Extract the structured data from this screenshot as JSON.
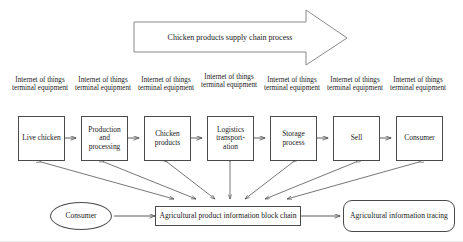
{
  "figure": {
    "title_banner": {
      "label": "Chicken products supply chain process",
      "shape": "block-arrow-right"
    },
    "iot_labels": [
      "Internet of things terminal equipment",
      "Internet of things terminal equipment",
      "Internet of things terminal equipment",
      "Internet of things terminal equipment",
      "Internet of things terminal equipment",
      "Internet of things terminal equipment",
      "Internet of things terminal equipment"
    ],
    "chain_stages": [
      {
        "label": "Live chicken"
      },
      {
        "label": "Production and processing"
      },
      {
        "label": "Chicken products"
      },
      {
        "label": "Logistics transport-ation"
      },
      {
        "label": "Storage process"
      },
      {
        "label": "Sell"
      },
      {
        "label": "Consumer"
      }
    ],
    "bottom_row": {
      "consumer_node": "Consumer",
      "blockchain_node": "Agricultural product information block chain",
      "tracing_node": "Agricultural information tracing"
    },
    "colors": {
      "stroke": "#4a4a4a",
      "text": "#1a1a1a",
      "background": "#ffffff"
    }
  }
}
